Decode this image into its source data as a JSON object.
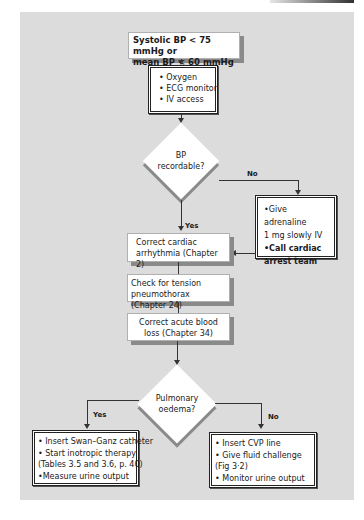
{
  "flowchart": {
    "start": {
      "line1": "Systolic BP < 75 mmHg or",
      "line2": "mean BP < 60 mmHg"
    },
    "initial_actions": {
      "items": [
        "• Oxygen",
        "• ECG monitor",
        "• IV access"
      ]
    },
    "decision1": {
      "line1": "BP",
      "line2": "recordable?",
      "no_label": "No",
      "yes_label": "Yes"
    },
    "no_branch": {
      "line1": "•Give adrenaline",
      "line2": "1 mg slowly IV",
      "line3": "•Call cardiac",
      "line4": "arrest team"
    },
    "step1": {
      "line1": "Correct cardiac",
      "line2": "arrhythmia (Chapter 2)"
    },
    "step2": {
      "line1": "Check for tension",
      "line2": "pneumothorax (Chapter 24)"
    },
    "step3": {
      "line1": "Correct acute blood",
      "line2": "loss (Chapter 34)"
    },
    "decision2": {
      "line1": "Pulmonary",
      "line2": "oedema?",
      "yes_label": "Yes",
      "no_label": "No"
    },
    "yes_outcome": {
      "items": [
        "• Insert Swan–Ganz catheter",
        "• Start inotropic therapy",
        "(Tables 3.5 and 3.6, p. 40)",
        "•Measure urine output"
      ]
    },
    "no_outcome": {
      "items": [
        "• Insert CVP line",
        "• Give fluid challenge",
        "(Fig 3·2)",
        "• Monitor urine output"
      ]
    }
  },
  "colors": {
    "panel": "#dcdcdc",
    "box": "#ffffff",
    "line": "#333333",
    "shadow": "#8a8a8a"
  }
}
